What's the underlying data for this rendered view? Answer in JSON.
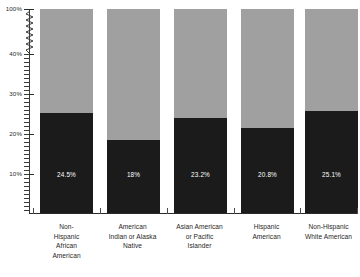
{
  "chart_data": {
    "type": "bar",
    "stacked": true,
    "title": "",
    "subtitle": "",
    "xlabel": "",
    "ylabel": "",
    "categories": [
      "Non-Hispanic African American",
      "American Indian or Alaska Native",
      "Asian American or Pacific Islander",
      "Hispanic American",
      "Non-Hispanic White American"
    ],
    "category_lines": [
      [
        "Non-",
        "Hispanic",
        "African",
        "American"
      ],
      [
        "American",
        "Indian or Alaska",
        "Native"
      ],
      [
        "Asian American",
        "or Pacific",
        "Islander"
      ],
      [
        "Hispanic",
        "American"
      ],
      [
        "Non-Hispanic",
        "White American"
      ]
    ],
    "series": [
      {
        "name": "lower-segment",
        "color": "#1b1b1b",
        "values": [
          24.5,
          18.0,
          23.2,
          20.8,
          25.1
        ],
        "labels": [
          "24.5%",
          "18%",
          "23.2%",
          "20.8%",
          "25.1%"
        ]
      },
      {
        "name": "upper-segment",
        "color": "#a0a0a0",
        "values": [
          75.5,
          82.0,
          76.8,
          79.2,
          74.9
        ],
        "labels": [
          "",
          "",
          "",
          "",
          ""
        ]
      }
    ],
    "ytick_labels": [
      "100%",
      "40%",
      "30%",
      "20%",
      "10%"
    ],
    "ytick_values": [
      100,
      40,
      30,
      20,
      10
    ],
    "ylim": [
      0,
      100
    ],
    "axis_break": true,
    "axis_break_between": [
      40,
      100
    ],
    "grid": false,
    "legend": "none"
  }
}
